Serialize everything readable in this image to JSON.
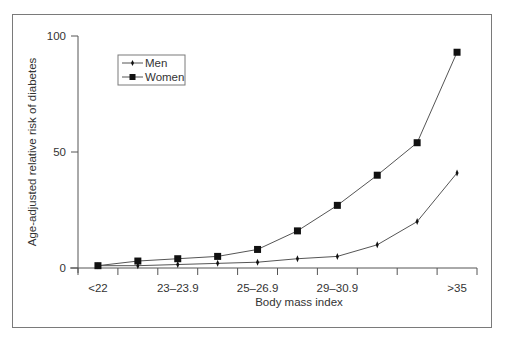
{
  "chart_data": {
    "type": "line",
    "title": "",
    "xlabel": "Body mass index",
    "ylabel": "Age-adjusted relative risk of diabetes",
    "categories": [
      "<22",
      "22–22.9",
      "23–23.9",
      "24–24.9",
      "25–26.9",
      "27–28.9",
      "29–30.9",
      "31–32.9",
      "33–34.9",
      ">35"
    ],
    "x_tick_labels_shown": [
      "<22",
      "",
      "23–23.9",
      "",
      "25–26.9",
      "",
      "29–30.9",
      "",
      "",
      ">35"
    ],
    "series": [
      {
        "name": "Men",
        "marker": "diamond",
        "values": [
          1.0,
          1.0,
          1.5,
          2.0,
          2.5,
          4.0,
          5.0,
          10.0,
          20.0,
          41.0
        ]
      },
      {
        "name": "Women",
        "marker": "square",
        "values": [
          1.0,
          3.0,
          4.0,
          5.0,
          8.0,
          16.0,
          27.0,
          40.0,
          54.0,
          93.0
        ]
      }
    ],
    "yticks": [
      0,
      50,
      100
    ],
    "ytick_labels": [
      "0",
      "50",
      "100"
    ],
    "ylim": [
      0,
      100
    ],
    "grid": false,
    "legend_position": "upper-left"
  },
  "colors": {
    "line": "#555555",
    "marker": "#111111",
    "axis": "#555555",
    "frame": "#7a7a7a"
  }
}
